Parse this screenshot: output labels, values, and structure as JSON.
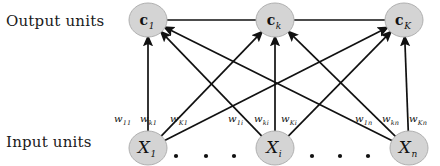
{
  "figure": {
    "background_color": "#ffffff",
    "node_fill": "#d4d4d4",
    "node_stroke": "#b0b0b0",
    "edge_color": "#111111"
  },
  "row_labels": {
    "output": "Output units",
    "input": "Input units"
  },
  "output_nodes": [
    {
      "id": "c1",
      "symbol": "c",
      "subscript": "1",
      "cx": 148,
      "cy": 20,
      "rx": 19,
      "ry": 17
    },
    {
      "id": "ck",
      "symbol": "c",
      "subscript": "k",
      "cx": 275,
      "cy": 20,
      "rx": 19,
      "ry": 17
    },
    {
      "id": "cK",
      "symbol": "c",
      "subscript": "K",
      "cx": 404,
      "cy": 20,
      "rx": 19,
      "ry": 17
    }
  ],
  "input_nodes": [
    {
      "id": "x1",
      "symbol": "X",
      "subscript": "1",
      "cx": 148,
      "cy": 148,
      "rx": 19,
      "ry": 17
    },
    {
      "id": "xi",
      "symbol": "X",
      "subscript": "i",
      "cx": 275,
      "cy": 148,
      "rx": 19,
      "ry": 17
    },
    {
      "id": "xn",
      "symbol": "X",
      "subscript": "n",
      "cx": 409,
      "cy": 148,
      "rx": 19,
      "ry": 17
    }
  ],
  "weight_labels": [
    {
      "w": "w",
      "sub": "11",
      "x": 114,
      "y": 122
    },
    {
      "w": "w",
      "sub": "k1",
      "x": 140,
      "y": 122
    },
    {
      "w": "w",
      "sub": "K1",
      "x": 170,
      "y": 122
    },
    {
      "w": "w",
      "sub": "1i",
      "x": 228,
      "y": 122
    },
    {
      "w": "w",
      "sub": "ki",
      "x": 254,
      "y": 122
    },
    {
      "w": "w",
      "sub": "Ki",
      "x": 281,
      "y": 122
    },
    {
      "w": "w",
      "sub": "1n",
      "x": 355,
      "y": 122
    },
    {
      "w": "w",
      "sub": "kn",
      "x": 382,
      "y": 122
    },
    {
      "w": "w",
      "sub": "Kn",
      "x": 409,
      "y": 122
    }
  ],
  "edges": [
    {
      "from": "x1",
      "to": "c1",
      "weight": "w11"
    },
    {
      "from": "x1",
      "to": "ck",
      "weight": "wk1"
    },
    {
      "from": "x1",
      "to": "cK",
      "weight": "wK1"
    },
    {
      "from": "xi",
      "to": "c1",
      "weight": "w1i"
    },
    {
      "from": "xi",
      "to": "ck",
      "weight": "wki"
    },
    {
      "from": "xi",
      "to": "cK",
      "weight": "wKi"
    },
    {
      "from": "xn",
      "to": "c1",
      "weight": "w1n"
    },
    {
      "from": "xn",
      "to": "ck",
      "weight": "wkn"
    },
    {
      "from": "xn",
      "to": "cK",
      "weight": "wKn"
    }
  ],
  "output_connector_lines": [
    {
      "x1": 167,
      "y1": 20,
      "x2": 256,
      "y2": 20
    },
    {
      "x1": 294,
      "y1": 20,
      "x2": 385,
      "y2": 20
    }
  ],
  "ellipsis_dots": [
    {
      "cx": 176,
      "cy": 156
    },
    {
      "cx": 206,
      "cy": 156
    },
    {
      "cx": 234,
      "cy": 156
    },
    {
      "cx": 312,
      "cy": 156
    },
    {
      "cx": 340,
      "cy": 156
    },
    {
      "cx": 368,
      "cy": 156
    }
  ]
}
